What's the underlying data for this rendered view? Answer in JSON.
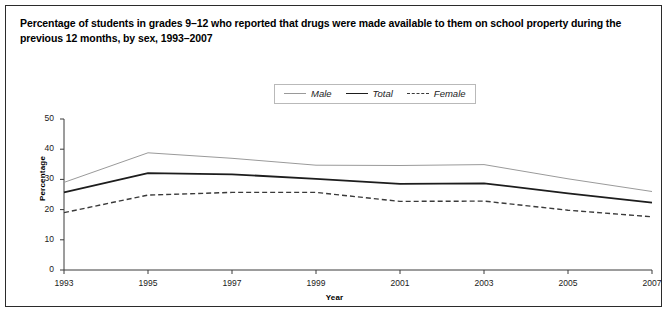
{
  "figure": {
    "title": "Percentage of students in grades 9–12 who reported that drugs were made available to them on school property during the previous 12 months, by sex, 1993–2007"
  },
  "legend": {
    "position": "top-center",
    "items": [
      {
        "label": "Male",
        "style": "thin-solid-gray",
        "color": "#9a9a9a"
      },
      {
        "label": "Total",
        "style": "thick-solid-black",
        "color": "#1d1d1d"
      },
      {
        "label": "Female",
        "style": "dashed",
        "color": "#3a3a3a"
      }
    ]
  },
  "axes": {
    "y_title": "Percentage",
    "x_title": "Year",
    "y_ticks": [
      "0",
      "10",
      "20",
      "30",
      "40",
      "50"
    ],
    "x_ticks": [
      "1993",
      "1995",
      "1997",
      "1999",
      "2001",
      "2003",
      "2005",
      "2007"
    ]
  },
  "chart_data": {
    "type": "line",
    "title": "Percentage of students in grades 9–12 who reported that drugs were made available to them on school property during the previous 12 months, by sex, 1993–2007",
    "xlabel": "Year",
    "ylabel": "Percentage",
    "x": [
      1993,
      1995,
      1997,
      1999,
      2001,
      2003,
      2005,
      2007
    ],
    "xlim": [
      1993,
      2007
    ],
    "ylim": [
      0,
      50
    ],
    "ytick_interval": 10,
    "grid": false,
    "legend_position": "top-center",
    "series": [
      {
        "name": "Male",
        "values": [
          29.0,
          38.8,
          37.0,
          34.7,
          34.6,
          34.9,
          30.2,
          26.0
        ],
        "color": "#9a9a9a",
        "linestyle": "solid",
        "linewidth": 1.0
      },
      {
        "name": "Total",
        "values": [
          25.7,
          32.1,
          31.7,
          30.2,
          28.5,
          28.7,
          25.4,
          22.3
        ],
        "color": "#1d1d1d",
        "linestyle": "solid",
        "linewidth": 1.8
      },
      {
        "name": "Female",
        "values": [
          19.0,
          24.8,
          25.7,
          25.7,
          22.7,
          22.8,
          19.8,
          17.6
        ],
        "color": "#3a3a3a",
        "linestyle": "dashed",
        "linewidth": 1.4
      }
    ]
  }
}
